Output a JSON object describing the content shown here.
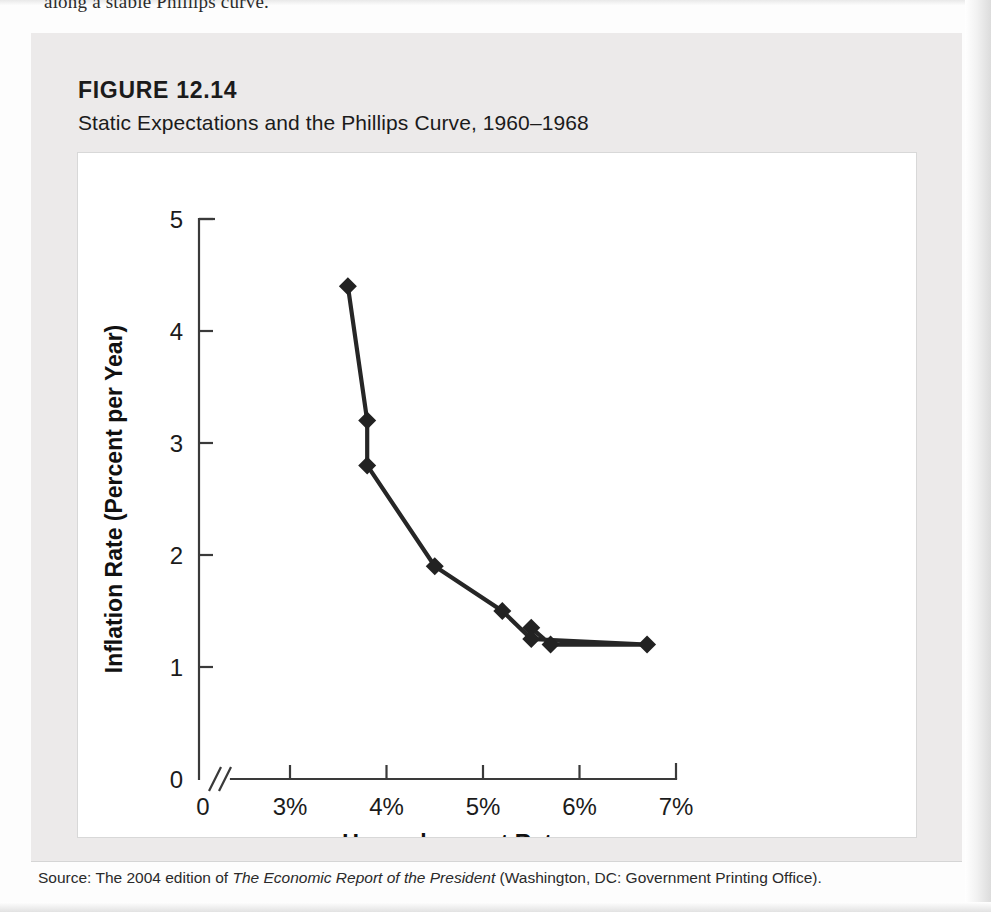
{
  "page": {
    "clipped_text_above_figure": "along a stable Phillips curve."
  },
  "figure": {
    "label": "FIGURE 12.14",
    "title": "Static Expectations and the Phillips Curve, 1960–1968",
    "background_color": "#eceaea",
    "panel_color": "#ffffff"
  },
  "source": {
    "prefix": "Source: The 2004 edition of ",
    "italic_part": "The Economic Report of the President",
    "suffix": " (Washington, DC: Government Printing Office)."
  },
  "chart_data": {
    "type": "line",
    "title": "Static Expectations and the Phillips Curve, 1960–1968",
    "xlabel": "Unemployment Rate",
    "ylabel": "Inflation Rate (Percent per Year)",
    "xlim": [
      2.5,
      7
    ],
    "ylim": [
      0,
      5
    ],
    "xticks": [
      3,
      4,
      5,
      6,
      7
    ],
    "xtick_labels": [
      "3%",
      "4%",
      "5%",
      "6%",
      "7%"
    ],
    "yticks": [
      0,
      1,
      2,
      3,
      4,
      5
    ],
    "ytick_labels": [
      "0",
      "1",
      "2",
      "3",
      "4",
      "5"
    ],
    "x_origin_label": "0",
    "y_origin_label": "0",
    "axis_break": true,
    "grid": false,
    "legend": false,
    "marker": "diamond",
    "line_color": "#262626",
    "marker_color": "#222222",
    "series": [
      {
        "name": "Phillips curve 1960–1968",
        "points": [
          {
            "x": 5.5,
            "y": 1.35
          },
          {
            "x": 5.7,
            "y": 1.2
          },
          {
            "x": 6.7,
            "y": 1.2
          },
          {
            "x": 5.5,
            "y": 1.25
          },
          {
            "x": 5.2,
            "y": 1.5
          },
          {
            "x": 4.5,
            "y": 1.9
          },
          {
            "x": 3.8,
            "y": 2.8
          },
          {
            "x": 3.8,
            "y": 3.2
          },
          {
            "x": 3.6,
            "y": 4.4
          }
        ]
      }
    ]
  }
}
